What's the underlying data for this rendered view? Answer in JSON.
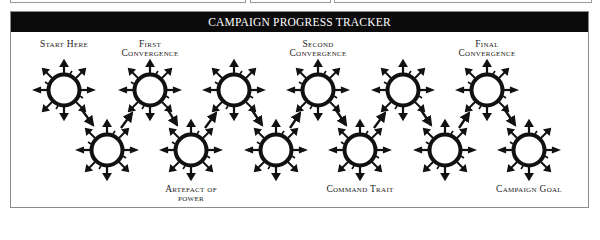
{
  "panel": {
    "title": "CAMPAIGN PROGRESS TRACKER"
  },
  "colors": {
    "header_bg": "#0b0b0b",
    "header_text": "#ffffff",
    "node_ink": "#111111",
    "border": "#8a8a8a"
  },
  "nodes": {
    "top": [
      {
        "x": 64,
        "y": 90
      },
      {
        "x": 150,
        "y": 90
      },
      {
        "x": 234,
        "y": 90
      },
      {
        "x": 318,
        "y": 90
      },
      {
        "x": 403,
        "y": 90
      },
      {
        "x": 487,
        "y": 90
      }
    ],
    "bottom": [
      {
        "x": 107,
        "y": 150
      },
      {
        "x": 191,
        "y": 150
      },
      {
        "x": 276,
        "y": 150
      },
      {
        "x": 360,
        "y": 150
      },
      {
        "x": 445,
        "y": 150
      },
      {
        "x": 529,
        "y": 150
      }
    ]
  },
  "labels": {
    "start": {
      "line1": "Start Here"
    },
    "first": {
      "line1": "First",
      "line2": "Convergence"
    },
    "second": {
      "line1": "Second",
      "line2": "Convergence"
    },
    "final": {
      "line1": "Final",
      "line2": "Convergence"
    },
    "artefact": {
      "line1": "Artefact of",
      "line2": "power"
    },
    "command": {
      "line1": "Command Trait"
    },
    "goal": {
      "line1": "Campaign Goal"
    }
  },
  "icons": {
    "node": "spiked-circle-icon",
    "connector": "arrow-icon"
  }
}
